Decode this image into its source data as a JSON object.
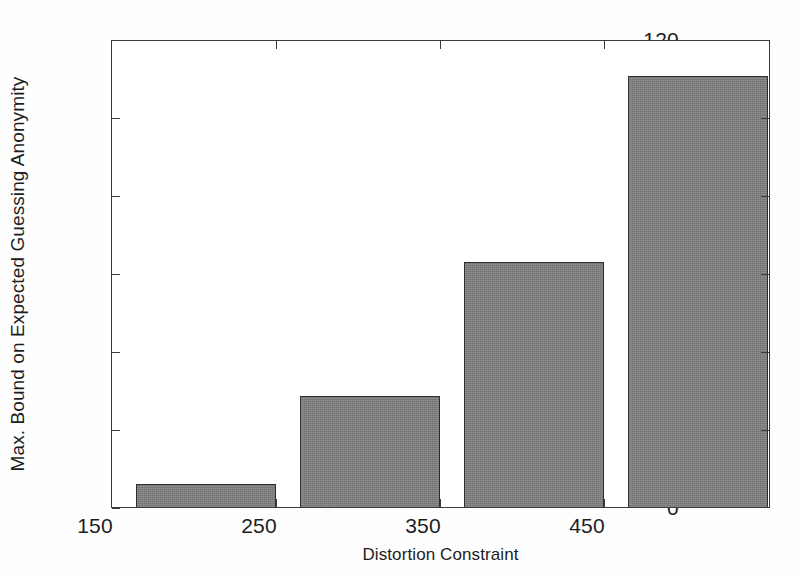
{
  "chart_data": {
    "type": "bar",
    "title": "",
    "subtitle": "",
    "xlabel": "Distortion Constraint",
    "ylabel": "Max. Bound on Expected Guessing Anonymity",
    "categories": [
      "150",
      "250",
      "350",
      "450"
    ],
    "values": [
      6,
      28.5,
      63,
      111
    ],
    "series": [
      {
        "name": "Max. Bound on Expected Guessing Anonymity",
        "values": [
          6,
          28.5,
          63,
          111
        ]
      }
    ],
    "ylim": [
      0,
      120
    ],
    "ytick_labels": [
      "0",
      "20",
      "40",
      "60",
      "80",
      "100",
      "120"
    ],
    "ytick_values": [
      0,
      20,
      40,
      60,
      80,
      100,
      120
    ],
    "xtick_labels": [
      "150",
      "250",
      "350",
      "450"
    ],
    "grid": false,
    "legend": false,
    "legend_position": "none",
    "bar_color": "#7f7f7f",
    "bar_edge_color": "#2e2e2e",
    "axis_color": "#3a3a3a",
    "background_color": "#ffffff"
  }
}
